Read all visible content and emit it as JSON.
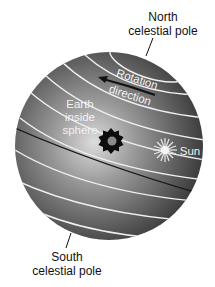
{
  "diagram": {
    "labels": {
      "north_line1": "North",
      "north_line2": "celestial pole",
      "south_line1": "South",
      "south_line2": "celestial pole",
      "rotation": "Rotation",
      "direction": "direction",
      "earth_line1": "Earth",
      "earth_line2": "inside",
      "earth_line3": "sphere",
      "sun": "Sun"
    },
    "icons": {
      "earth": "earth-starburst-icon",
      "sun": "sun-star-icon",
      "arrow": "rotation-arrow-icon"
    },
    "colors": {
      "sphere_light": "#d8d8d8",
      "sphere_dark": "#3a3a3a",
      "circle_lines": "#f0f0f0",
      "label_text": "#111111"
    }
  }
}
